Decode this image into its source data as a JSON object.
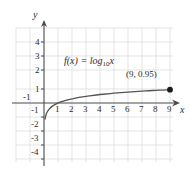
{
  "chart_data": {
    "type": "line",
    "title": "",
    "function_label": "f(x) = log",
    "function_base": "10",
    "function_arg": "x",
    "xlabel": "x",
    "ylabel": "y",
    "xlim": [
      -2,
      10
    ],
    "ylim": [
      -4.8,
      4.8
    ],
    "grid": true,
    "legend": "none",
    "x_ticks": [
      -1,
      1,
      2,
      3,
      4,
      5,
      6,
      7,
      8,
      9
    ],
    "x_tick_labels": [
      "-1",
      "1",
      "2",
      "3",
      "4",
      "5",
      "6",
      "7",
      "8",
      "9"
    ],
    "y_ticks": [
      4,
      3,
      2,
      1,
      -1,
      -2,
      -3,
      -4
    ],
    "y_tick_labels": [
      "4",
      "3",
      "2",
      "1",
      "-1",
      "-2",
      "-3",
      "-4"
    ],
    "series": [
      {
        "name": "f(x) = log10 x",
        "color": "#555555",
        "x": [
          0.07,
          0.1,
          0.15,
          0.2,
          0.3,
          0.4,
          0.5,
          0.7,
          1.0,
          1.3,
          1.7,
          2.0,
          2.5,
          3.0,
          3.5,
          4.0,
          4.5,
          5.0,
          5.5,
          6.0,
          6.5,
          7.0,
          7.5,
          8.0,
          8.5,
          9.0
        ],
        "y": [
          -1.15,
          -1.0,
          -0.82,
          -0.7,
          -0.52,
          -0.4,
          -0.3,
          -0.15,
          0.0,
          0.11,
          0.23,
          0.3,
          0.4,
          0.48,
          0.54,
          0.6,
          0.65,
          0.7,
          0.74,
          0.78,
          0.81,
          0.85,
          0.88,
          0.9,
          0.93,
          0.95
        ]
      }
    ],
    "annotations": [
      {
        "name": "marked-point",
        "label": "(9, 0.95)",
        "x": 9,
        "y": 0.95,
        "marker": "filled-circle",
        "marker_color": "#1a1a1a"
      }
    ],
    "colors": {
      "grid": "#d9d9d9",
      "axis": "#4a4a4a",
      "curve": "#555555",
      "text": "#2b2b2b"
    }
  }
}
